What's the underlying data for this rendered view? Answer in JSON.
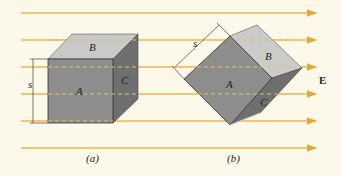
{
  "figure": {
    "field_label": "E",
    "colors": {
      "background": "#fdf9ea",
      "field_line": "#e8b84a",
      "face_front": "#8c8c8c",
      "face_top": "#c8c8c6",
      "face_side": "#6e6e6e"
    },
    "panel_a": {
      "caption": "(a)",
      "faces": {
        "front": "A",
        "top": "B",
        "side": "C"
      },
      "dimension_label": "s"
    },
    "panel_b": {
      "caption": "(b)",
      "faces": {
        "front": "A",
        "top": "B",
        "side": "C"
      },
      "dimension_label": "s"
    }
  }
}
